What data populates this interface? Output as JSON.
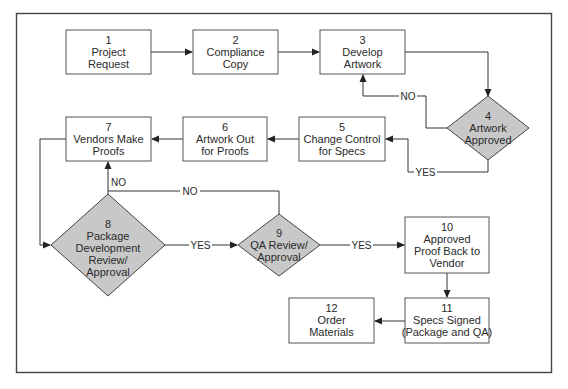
{
  "diagram": {
    "type": "flowchart",
    "colors": {
      "box_fill": "#ffffff",
      "box_stroke": "#555555",
      "decision_fill": "#c8c8c8",
      "decision_stroke": "#444444",
      "line": "#333333",
      "frame": "#444444",
      "text": "#2a2a2a"
    },
    "nodes": [
      {
        "id": "1",
        "shape": "box",
        "number": "1",
        "lines": [
          "Project",
          "Request"
        ]
      },
      {
        "id": "2",
        "shape": "box",
        "number": "2",
        "lines": [
          "Compliance",
          "Copy"
        ]
      },
      {
        "id": "3",
        "shape": "box",
        "number": "3",
        "lines": [
          "Develop",
          "Artwork"
        ]
      },
      {
        "id": "4",
        "shape": "decision",
        "number": "4",
        "lines": [
          "Artwork",
          "Approved"
        ]
      },
      {
        "id": "5",
        "shape": "box",
        "number": "5",
        "lines": [
          "Change Control",
          "for Specs"
        ]
      },
      {
        "id": "6",
        "shape": "box",
        "number": "6",
        "lines": [
          "Artwork Out",
          "for Proofs"
        ]
      },
      {
        "id": "7",
        "shape": "box",
        "number": "7",
        "lines": [
          "Vendors Make",
          "Proofs"
        ]
      },
      {
        "id": "8",
        "shape": "decision",
        "number": "8",
        "lines": [
          "Package",
          "Development",
          "Review/",
          "Approval"
        ]
      },
      {
        "id": "9",
        "shape": "decision",
        "number": "9",
        "lines": [
          "QA Review/",
          "Approval"
        ]
      },
      {
        "id": "10",
        "shape": "box",
        "number": "10",
        "lines": [
          "Approved",
          "Proof Back to",
          "Vendor"
        ]
      },
      {
        "id": "11",
        "shape": "box",
        "number": "11",
        "lines": [
          "Specs Signed",
          "(Package and QA)"
        ]
      },
      {
        "id": "12",
        "shape": "box",
        "number": "12",
        "lines": [
          "Order",
          "Materials"
        ]
      }
    ],
    "edges": [
      {
        "from": "1",
        "to": "2",
        "label": ""
      },
      {
        "from": "2",
        "to": "3",
        "label": ""
      },
      {
        "from": "3",
        "to": "4",
        "label": ""
      },
      {
        "from": "4",
        "to": "3",
        "label": "NO"
      },
      {
        "from": "4",
        "to": "5",
        "label": "YES"
      },
      {
        "from": "5",
        "to": "6",
        "label": ""
      },
      {
        "from": "6",
        "to": "7",
        "label": ""
      },
      {
        "from": "7",
        "to": "8",
        "label": ""
      },
      {
        "from": "8",
        "to": "7",
        "label": "NO"
      },
      {
        "from": "9",
        "to": "7",
        "label": "NO"
      },
      {
        "from": "8",
        "to": "9",
        "label": "YES"
      },
      {
        "from": "9",
        "to": "10",
        "label": "YES"
      },
      {
        "from": "10",
        "to": "11",
        "label": ""
      },
      {
        "from": "11",
        "to": "12",
        "label": ""
      }
    ],
    "edge_labels": {
      "no_4_to_3": "NO",
      "yes_4_to_5": "YES",
      "no_8_to_7": "NO",
      "no_9_to_7": "NO",
      "yes_8_to_9": "YES",
      "yes_9_to_10": "YES"
    }
  }
}
